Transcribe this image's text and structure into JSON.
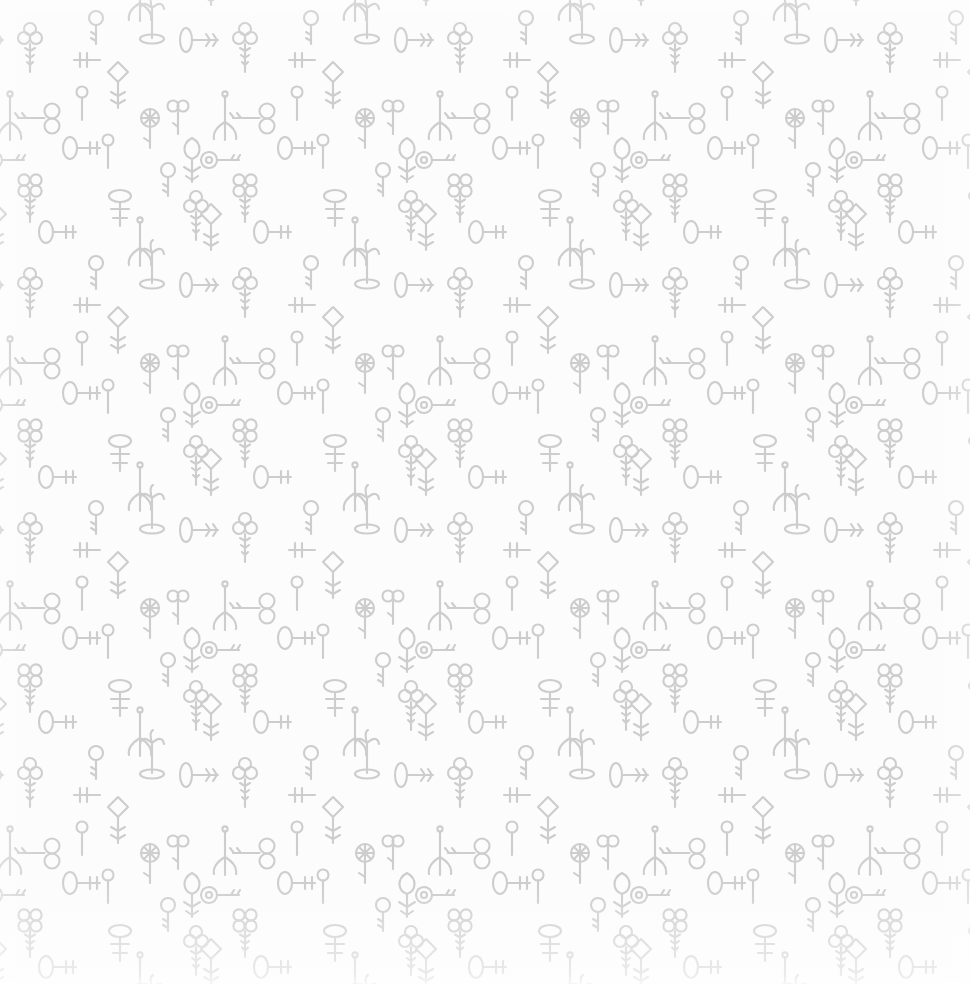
{
  "document": {
    "title": "Seamless Vintage Keys Pattern",
    "kind": "decorative-wallpaper",
    "width_px": 970,
    "height_px": 984,
    "alt_text": "Seamless repeating wallpaper pattern of hand-drawn light grey vintage skeleton keys on an off-white background"
  },
  "palette": {
    "background": "#fcfcfc",
    "background_highlight": "#ffffff",
    "key_stroke": "#cdcdcd",
    "key_stroke_soft": "#d6d6d6",
    "key_fill": "none"
  },
  "pattern": {
    "repeat": "both",
    "tile_width_px": 215,
    "tile_height_px": 245,
    "stroke_width": 2.1,
    "style": "hand-drawn doodle line art",
    "motif_count_per_tile": 22,
    "motifs": [
      {
        "name": "trefoil-bow-key",
        "description": "three-circle clover bow with toothed bit"
      },
      {
        "name": "quatrefoil-bow-key",
        "description": "four-circle flower bow with toothed bit"
      },
      {
        "name": "round-bow-key",
        "description": "simple round ring bow with short bit"
      },
      {
        "name": "keyhole-bow-key",
        "description": "round bow with inner circle keyhole"
      },
      {
        "name": "diamond-bow-key",
        "description": "rhombus diamond bow with starburst bit"
      },
      {
        "name": "figure-eight-key",
        "description": "two stacked circles forming a figure eight bow"
      },
      {
        "name": "oval-bow-key",
        "description": "tall oval bow with comb bit"
      },
      {
        "name": "crown-bow-key",
        "description": "flattened oval bow with crown-like cross bit"
      },
      {
        "name": "tulip-bow-key",
        "description": "tapered tulip shaped bow with forked bit"
      },
      {
        "name": "whisk-key",
        "description": "long shaft splaying into three curled tines"
      },
      {
        "name": "palm-key",
        "description": "shaft topped with splayed frond-like bow"
      },
      {
        "name": "barrel-key",
        "description": "horizontal barrel bow with spoked wheel"
      },
      {
        "name": "spoked-wheel-key",
        "description": "circular bow with internal cross spokes"
      },
      {
        "name": "lollipop-key",
        "description": "small circle bow on a plain straight shaft"
      },
      {
        "name": "wishbone-key",
        "description": "pair of lobes above a slim stem"
      }
    ]
  },
  "layers": [
    {
      "name": "tile-layer",
      "label": "Repeating key motif tile"
    },
    {
      "name": "vignette",
      "label": "Soft white edge fade"
    },
    {
      "name": "sheen",
      "label": "Radial white sheen"
    }
  ]
}
